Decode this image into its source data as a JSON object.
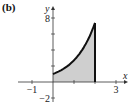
{
  "panel_label": "(b)",
  "chart_data": {
    "type": "area",
    "title": "",
    "xlabel": "x",
    "ylabel": "y",
    "function": "y = e^x",
    "shaded_region": {
      "x_from": 0,
      "x_to": 2,
      "fill": "#cfcfcf"
    },
    "x": [
      0,
      0.25,
      0.5,
      0.75,
      1,
      1.25,
      1.5,
      1.75,
      2
    ],
    "values": [
      1,
      1.28,
      1.65,
      2.12,
      2.72,
      3.49,
      4.48,
      5.75,
      7.39
    ],
    "xlim": [
      -1.5,
      3.3
    ],
    "ylim": [
      -2.5,
      8.5
    ],
    "x_ticks": [
      -1,
      1,
      2,
      3
    ],
    "x_tick_labels": [
      {
        "value": -1,
        "label": "−1"
      },
      {
        "value": 3,
        "label": "3"
      }
    ],
    "y_ticks": [
      -2,
      2,
      4,
      6,
      8
    ],
    "y_tick_labels": [
      {
        "value": 8,
        "label": "8"
      },
      {
        "value": -2,
        "label": "−2"
      }
    ],
    "grid": false,
    "legend": null,
    "curve_color": "#111111"
  }
}
